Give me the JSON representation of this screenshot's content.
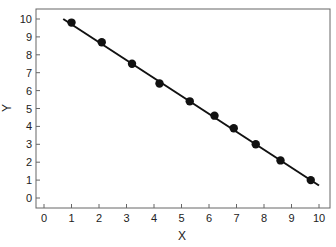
{
  "chart_data": {
    "type": "scatter",
    "title": "",
    "xlabel": "X",
    "ylabel": "Y",
    "xlim": [
      -0.3,
      10.5
    ],
    "ylim": [
      -0.6,
      10.6
    ],
    "xticks": [
      0,
      1,
      2,
      3,
      4,
      5,
      6,
      7,
      8,
      9,
      10
    ],
    "yticks": [
      0,
      1,
      2,
      3,
      4,
      5,
      6,
      7,
      8,
      9,
      10
    ],
    "grid": false,
    "legend": null,
    "series": [
      {
        "name": "data points",
        "marker": "filled-circle",
        "color": "#111111",
        "x": [
          1.0,
          2.1,
          3.2,
          4.2,
          5.3,
          6.2,
          6.9,
          7.7,
          8.6,
          9.7
        ],
        "y": [
          9.8,
          8.7,
          7.5,
          6.4,
          5.4,
          4.6,
          3.9,
          3.0,
          2.1,
          1.0
        ]
      }
    ],
    "fit_line": {
      "type": "linear",
      "color": "#111111",
      "x": [
        0.7,
        10.0
      ],
      "y": [
        10.0,
        0.7
      ]
    }
  },
  "colors": {
    "frame": "#666666",
    "marker": "#111111",
    "line": "#111111"
  }
}
